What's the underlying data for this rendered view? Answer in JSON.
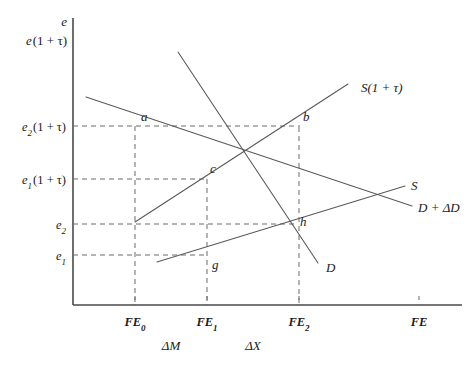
{
  "figure": {
    "type": "economics-line-diagram",
    "background_color": "#ffffff",
    "line_color": "#5a5a5a",
    "axis_color": "#4a4a4a",
    "text_color": "#1a1a1a"
  },
  "axes": {
    "y_axis_label": "e",
    "y_axis_label_secondary": "e(1 + τ)",
    "x_axis_label": "FE",
    "y_ticks": [
      {
        "id": "e2tau",
        "label_base": "e",
        "label_sub": "2",
        "label_rest": "(1 + τ)",
        "y": 126
      },
      {
        "id": "e1tau",
        "label_base": "e",
        "label_sub": "1",
        "label_rest": "(1 + τ)",
        "y": 179
      },
      {
        "id": "e2",
        "label_base": "e",
        "label_sub": "2",
        "label_rest": "",
        "y": 224
      },
      {
        "id": "e1",
        "label_base": "e",
        "label_sub": "1",
        "label_rest": "",
        "y": 255
      }
    ],
    "x_ticks": [
      {
        "id": "FE0",
        "label_base": "FE",
        "label_sub": "0",
        "x": 135
      },
      {
        "id": "FE1",
        "label_base": "FE",
        "label_sub": "1",
        "x": 207
      },
      {
        "id": "FE2",
        "label_base": "FE",
        "label_sub": "2",
        "x": 299
      },
      {
        "id": "FE",
        "label_base": "FE",
        "label_sub": "",
        "x": 419
      }
    ],
    "interval_labels": [
      {
        "id": "deltaM",
        "label": "ΔM",
        "x": 171
      },
      {
        "id": "deltaX",
        "label": "ΔX",
        "x": 253
      }
    ]
  },
  "curves": [
    {
      "id": "D_plus_dD",
      "label": "D + ΔD",
      "label_x": 418,
      "label_y": 212,
      "x1": 86,
      "y1": 97,
      "x2": 412,
      "y2": 206
    },
    {
      "id": "D",
      "label": "D",
      "label_x": 326,
      "label_y": 272,
      "x1": 178,
      "y1": 52,
      "x2": 318,
      "y2": 263
    },
    {
      "id": "S_plus_tau",
      "label": "S(1 + τ)",
      "label_x": 361,
      "label_y": 92,
      "x1": 135,
      "y1": 222,
      "x2": 348,
      "y2": 84
    },
    {
      "id": "S",
      "label": "S",
      "label_x": 411,
      "label_y": 190,
      "x1": 157,
      "y1": 262,
      "x2": 405,
      "y2": 186
    }
  ],
  "points": [
    {
      "id": "a",
      "label": "a",
      "x": 135,
      "y": 126,
      "label_dx": 6,
      "label_dy": -5
    },
    {
      "id": "b",
      "label": "b",
      "x": 299,
      "y": 127,
      "label_dx": 4,
      "label_dy": -6
    },
    {
      "id": "c",
      "label": "c",
      "x": 207,
      "y": 179,
      "label_dx": 3,
      "label_dy": -6
    },
    {
      "id": "h",
      "label": "h",
      "x": 296,
      "y": 229,
      "label_dx": 4,
      "label_dy": -3
    },
    {
      "id": "g",
      "label": "g",
      "x": 207,
      "y": 255,
      "label_dx": 5,
      "label_dy": 14
    }
  ],
  "guides": {
    "horizontal": [
      {
        "id": "guide-e2tau",
        "y": 126,
        "x_start": 73,
        "x_end": 300
      },
      {
        "id": "guide-e1tau",
        "y": 179,
        "x_start": 73,
        "x_end": 208
      },
      {
        "id": "guide-e2",
        "y": 224,
        "x_start": 73,
        "x_end": 298
      },
      {
        "id": "guide-e1",
        "y": 255,
        "x_start": 73,
        "x_end": 208
      }
    ],
    "vertical": [
      {
        "id": "guide-FE0",
        "x": 135,
        "y_start": 126,
        "y_end": 305
      },
      {
        "id": "guide-FE1",
        "x": 207,
        "y_start": 179,
        "y_end": 305
      },
      {
        "id": "guide-FE2",
        "x": 299,
        "y_start": 127,
        "y_end": 305
      }
    ]
  },
  "geometry": {
    "y_axis_x": 73,
    "x_axis_y": 305,
    "y_axis_top": 18,
    "x_axis_right": 462
  }
}
